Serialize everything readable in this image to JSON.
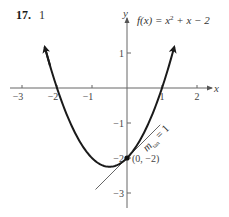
{
  "header": {
    "problem_number": "17.",
    "sub_label": "1"
  },
  "chart_data": {
    "type": "line",
    "title": "",
    "function_label": "f(x) = x² + x − 2",
    "xlabel": "x",
    "ylabel": "y",
    "xlim": [
      -3.2,
      2.4
    ],
    "ylim": [
      -3.3,
      2.2
    ],
    "x_ticks": [
      -3,
      -2,
      -1,
      1,
      2
    ],
    "x_tick_labels": [
      "−3",
      "−2",
      "−1",
      "1",
      "2"
    ],
    "y_ticks": [
      1,
      -1,
      -2,
      -3
    ],
    "y_tick_labels": [
      "1",
      "−1",
      "−2",
      "−3"
    ],
    "grid": false,
    "series": [
      {
        "name": "f(x) = x² + x − 2",
        "kind": "curve",
        "x_range": [
          -2.35,
          1.35
        ],
        "points": [
          [
            -2.35,
            1.17
          ],
          [
            -2,
            0
          ],
          [
            -1,
            -2
          ],
          [
            -0.5,
            -2.25
          ],
          [
            0,
            -2
          ],
          [
            1,
            0
          ],
          [
            1.35,
            1.17
          ]
        ],
        "color": "#1a1a1a"
      },
      {
        "name": "tangent line",
        "kind": "line",
        "slope": 1,
        "intercept": -2,
        "x_range": [
          -0.9,
          0.95
        ],
        "color": "#555555"
      }
    ],
    "annotations": [
      {
        "text": "(0, −2)",
        "x": 0,
        "y": -2,
        "marker": "filled-dot"
      },
      {
        "text": "m_tan = 1",
        "x": 0.7,
        "y": -1.3,
        "rotation": -45
      }
    ]
  },
  "labels": {
    "point": "(0, −2)",
    "slope_m": "m",
    "slope_sub": "tan",
    "slope_eq": " = 1",
    "x_axis": "x",
    "y_axis": "y",
    "func_f": "f(x) = x",
    "func_exp": "2",
    "func_rest": " + x − 2"
  }
}
